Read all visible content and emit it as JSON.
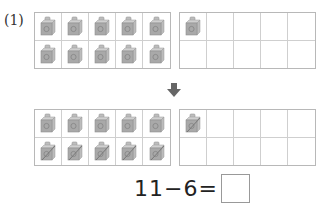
{
  "problem": {
    "number_label": "(1)",
    "before": {
      "left_frame": {
        "rows": 2,
        "cols": 5,
        "cubes": [
          1,
          1,
          1,
          1,
          1,
          1,
          1,
          1,
          1,
          1
        ],
        "crossed": [
          0,
          0,
          0,
          0,
          0,
          0,
          0,
          0,
          0,
          0
        ]
      },
      "right_frame": {
        "rows": 2,
        "cols": 5,
        "cubes": [
          1,
          0,
          0,
          0,
          0,
          0,
          0,
          0,
          0,
          0
        ],
        "crossed": [
          0,
          0,
          0,
          0,
          0,
          0,
          0,
          0,
          0,
          0
        ]
      }
    },
    "arrow_icon": "down-arrow",
    "after": {
      "left_frame": {
        "rows": 2,
        "cols": 5,
        "cubes": [
          1,
          1,
          1,
          1,
          1,
          1,
          1,
          1,
          1,
          1
        ],
        "crossed": [
          0,
          0,
          0,
          0,
          0,
          1,
          1,
          1,
          1,
          1
        ]
      },
      "right_frame": {
        "rows": 2,
        "cols": 5,
        "cubes": [
          1,
          0,
          0,
          0,
          0,
          0,
          0,
          0,
          0,
          0
        ],
        "crossed": [
          1,
          0,
          0,
          0,
          0,
          0,
          0,
          0,
          0,
          0
        ]
      }
    },
    "equation": {
      "text": "11−6=",
      "answer": ""
    }
  },
  "colors": {
    "cube_face": "#a9a9a9",
    "cube_side": "#c4c4c4",
    "grid_line": "#cfcfcf",
    "arrow": "#666666"
  }
}
